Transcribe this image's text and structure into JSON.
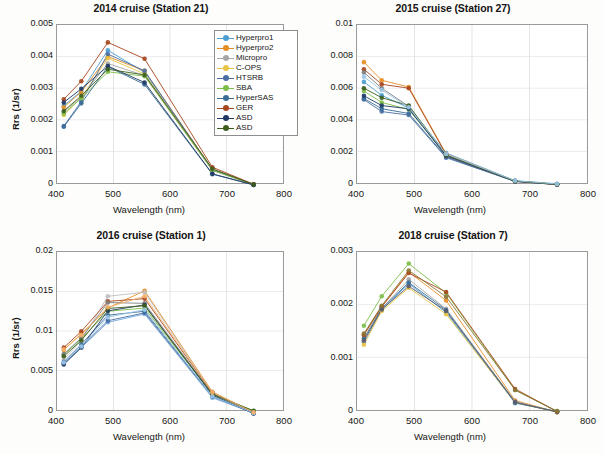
{
  "figure": {
    "xlabel": "Wavelength (nm)",
    "ylabel": "Rrs (1/sr)",
    "xticks": [
      "400",
      "500",
      "600",
      "700",
      "800"
    ],
    "xlim": [
      400,
      800
    ],
    "wavelengths": [
      412,
      443,
      490,
      555,
      675,
      748
    ]
  },
  "colors": {
    "hyperpro1": "#4E9FD1",
    "hyperpro2": "#E58E26",
    "hyperpro3": "#A6A6A6",
    "hyperpro4": "#E8C547",
    "micropro": "#A6A6A6",
    "cops": "#E8C547",
    "htsrb": "#4A6FA5",
    "sba": "#7DBE4A",
    "hypersas": "#3A6E97",
    "ger": "#A8461E",
    "sev": "#7F7F7F",
    "sev1": "#5A5A6E",
    "sev2": "#8A7536",
    "asd": "#1F3864",
    "asd1": "#1F3864",
    "asd2": "#3E5E1E",
    "asd3": "#9CC8E8",
    "asd4": "#F3B169"
  },
  "chart_data": [
    {
      "id": "panel-1",
      "type": "line",
      "title": "2014 cruise (Station 21)",
      "xlabel": "Wavelength (nm)",
      "ylabel": "Rrs (1/sr)",
      "xlim": [
        400,
        800
      ],
      "ylim": [
        0,
        0.005
      ],
      "yticks": [
        "0",
        "0.001",
        "0.002",
        "0.003",
        "0.004",
        "0.005"
      ],
      "ytickvals": [
        0,
        0.001,
        0.002,
        0.003,
        0.004,
        0.005
      ],
      "grid": true,
      "legend_position": "upper-right",
      "x": [
        412,
        443,
        490,
        555,
        675,
        748
      ],
      "series": [
        {
          "name": "Hyperpro1",
          "color": "#4E9FD1",
          "values": [
            0.00245,
            0.0029,
            0.0042,
            0.0035,
            0.00043,
            -4e-05
          ]
        },
        {
          "name": "Hyperpro2",
          "color": "#E58E26",
          "values": [
            0.0024,
            0.00288,
            0.004,
            0.00355,
            0.00044,
            -4e-05
          ]
        },
        {
          "name": "Micropro",
          "color": "#A6A6A6",
          "values": [
            0.00225,
            0.00272,
            0.00378,
            0.0034,
            0.0004,
            -5e-05
          ]
        },
        {
          "name": "C-OPS",
          "color": "#E8C547",
          "values": [
            0.00215,
            0.0027,
            0.00395,
            0.00345,
            0.00041,
            -5e-05
          ]
        },
        {
          "name": "HTSRB",
          "color": "#4A6FA5",
          "values": [
            0.0018,
            0.00258,
            0.00408,
            0.00355,
            0.00042,
            -4e-05
          ]
        },
        {
          "name": "SBA",
          "color": "#7DBE4A",
          "values": [
            0.0022,
            0.00268,
            0.00352,
            0.00338,
            0.0004,
            -5e-05
          ]
        },
        {
          "name": "HyperSAS",
          "color": "#3A6E97",
          "values": [
            0.00178,
            0.00252,
            0.00368,
            0.00312,
            0.00028,
            -6e-05
          ]
        },
        {
          "name": "GER",
          "color": "#A8461E",
          "values": [
            0.00265,
            0.00322,
            0.00445,
            0.00393,
            0.0005,
            -4e-05
          ]
        },
        {
          "name": "ASD",
          "color": "#1F3864",
          "values": [
            0.00255,
            0.00298,
            0.0037,
            0.00318,
            0.00029,
            -6e-05
          ]
        },
        {
          "name": "ASD",
          "color": "#3E5E1E",
          "values": [
            0.00228,
            0.00276,
            0.0036,
            0.00342,
            0.00045,
            -5e-05
          ]
        }
      ]
    },
    {
      "id": "panel-2",
      "type": "line",
      "title": "2015 cruise (Station 27)",
      "xlabel": "Wavelength (nm)",
      "ylabel": "Rrs (1/sr)",
      "xlim": [
        400,
        800
      ],
      "ylim": [
        0,
        0.01
      ],
      "yticks": [
        "0",
        "0.002",
        "0.004",
        "0.006",
        "0.008",
        "0.01"
      ],
      "ytickvals": [
        0,
        0.002,
        0.004,
        0.006,
        0.008,
        0.01
      ],
      "grid": true,
      "legend_position": "upper-right",
      "x": [
        412,
        443,
        490,
        555,
        675,
        748
      ],
      "series": [
        {
          "name": "Hyperpro1",
          "color": "#4E9FD1",
          "values": [
            0.0064,
            0.00555,
            0.00475,
            0.0019,
            0.00015,
            -5e-05
          ]
        },
        {
          "name": "Hyperpro2",
          "color": "#E58E26",
          "values": [
            0.00765,
            0.0065,
            0.00608,
            0.00185,
            0.00012,
            -8e-05
          ]
        },
        {
          "name": "HTSRB",
          "color": "#4A6FA5",
          "values": [
            0.00528,
            0.00452,
            0.0043,
            0.0016,
            0.0001,
            -0.0001
          ]
        },
        {
          "name": "SBA",
          "color": "#7DBE4A",
          "values": [
            0.00582,
            0.0051,
            0.00465,
            0.00175,
            0.00012,
            -8e-05
          ]
        },
        {
          "name": "HyperSAS",
          "color": "#3A6E97",
          "values": [
            0.00535,
            0.0047,
            0.0044,
            0.00165,
            0.0001,
            -9e-05
          ]
        },
        {
          "name": "GER",
          "color": "#A8461E",
          "values": [
            0.0072,
            0.00625,
            0.006,
            0.0018,
            0.00012,
            -0.0001
          ]
        },
        {
          "name": "SEV",
          "color": "#7F7F7F",
          "values": [
            0.007,
            0.006,
            0.00485,
            0.0017,
            0.0001,
            -9e-05
          ]
        },
        {
          "name": "ASD 1",
          "color": "#1F3864",
          "values": [
            0.00552,
            0.0049,
            0.0047,
            0.00172,
            0.00011,
            -8e-05
          ]
        },
        {
          "name": "ASD 2",
          "color": "#3E5E1E",
          "values": [
            0.006,
            0.0054,
            0.0049,
            0.00178,
            0.00012,
            -8e-05
          ]
        },
        {
          "name": "ASD 3",
          "color": "#9CC8E8",
          "values": [
            0.00672,
            0.00588,
            0.0048,
            0.00183,
            0.00014,
            -6e-05
          ]
        }
      ]
    },
    {
      "id": "panel-3",
      "type": "line",
      "title": "2016 cruise (Station 1)",
      "xlabel": "Wavelength (nm)",
      "ylabel": "Rrs (1/sr)",
      "xlim": [
        400,
        800
      ],
      "ylim": [
        0,
        0.02
      ],
      "yticks": [
        "0",
        "0.005",
        "0.01",
        "0.015",
        "0.02"
      ],
      "ytickvals": [
        0,
        0.005,
        0.01,
        0.015,
        0.02
      ],
      "grid": true,
      "legend_position": "upper-right",
      "x": [
        412,
        443,
        490,
        555,
        675,
        748
      ],
      "series": [
        {
          "name": "Hyperpro1",
          "color": "#6FA8DC",
          "values": [
            0.0059,
            0.0079,
            0.0111,
            0.01215,
            0.00155,
            -0.0004
          ]
        },
        {
          "name": "Hyperpro2",
          "color": "#E58E26",
          "values": [
            0.0076,
            0.00965,
            0.0129,
            0.0151,
            0.0023,
            -0.0003
          ]
        },
        {
          "name": "Hyperpro3",
          "color": "#BFBFBF",
          "values": [
            0.0064,
            0.0088,
            0.0144,
            0.0149,
            0.00218,
            -0.00032
          ]
        },
        {
          "name": "HTSRB",
          "color": "#4A6FA5",
          "values": [
            0.00592,
            0.008,
            0.0113,
            0.0123,
            0.0017,
            -0.00038
          ]
        },
        {
          "name": "SBA",
          "color": "#7DBE4A",
          "values": [
            0.007,
            0.009,
            0.0125,
            0.0129,
            0.002,
            -0.00012
          ]
        },
        {
          "name": "HyperSAS",
          "color": "#3A6E97",
          "values": [
            0.0061,
            0.0083,
            0.012,
            0.0125,
            0.0018,
            -0.00042
          ]
        },
        {
          "name": "GER",
          "color": "#A8461E",
          "values": [
            0.0079,
            0.00995,
            0.01375,
            0.0141,
            0.00215,
            -0.00028
          ]
        },
        {
          "name": "SEV",
          "color": "#7F7F7F",
          "values": [
            0.0071,
            0.0091,
            0.0136,
            0.0135,
            0.00205,
            -0.0003
          ]
        },
        {
          "name": "ASD 1",
          "color": "#1F3864",
          "values": [
            0.00575,
            0.0079,
            0.01255,
            0.0133,
            0.0019,
            -0.00045
          ]
        },
        {
          "name": "ASD 2",
          "color": "#3E5E1E",
          "values": [
            0.0068,
            0.0088,
            0.01285,
            0.0132,
            0.002,
            -0.0001
          ]
        },
        {
          "name": "ASD 3",
          "color": "#9CC8E8",
          "values": [
            0.006,
            0.00805,
            0.01175,
            0.0127,
            0.00175,
            -0.00038
          ]
        },
        {
          "name": "ASD 4",
          "color": "#F3B169",
          "values": [
            0.0077,
            0.0095,
            0.013,
            0.0144,
            0.00222,
            -0.0003
          ]
        }
      ]
    },
    {
      "id": "panel-4",
      "type": "line",
      "title": "2018 cruise (Station 7)",
      "xlabel": "Wavelength (nm)",
      "ylabel": "Rrs (1/sr)",
      "xlim": [
        400,
        800
      ],
      "ylim": [
        0,
        0.003
      ],
      "yticks": [
        "0",
        "0.001",
        "0.002",
        "0.003"
      ],
      "ytickvals": [
        0,
        0.001,
        0.002,
        0.003
      ],
      "grid": true,
      "legend_position": "upper-right",
      "x": [
        412,
        443,
        490,
        555,
        675,
        748
      ],
      "series": [
        {
          "name": "Hyperpro1",
          "color": "#4E9FD1",
          "values": [
            0.00128,
            0.0019,
            0.0024,
            0.00185,
            0.00013,
            -3e-05
          ]
        },
        {
          "name": "Hyperpro2",
          "color": "#E58E26",
          "values": [
            0.00142,
            0.00196,
            0.00262,
            0.00208,
            0.00018,
            -4e-05
          ]
        },
        {
          "name": "Hyperpro3",
          "color": "#A6A6A6",
          "values": [
            0.0013,
            0.00192,
            0.00248,
            0.00192,
            0.00016,
            -4e-05
          ]
        },
        {
          "name": "Hyperpro4",
          "color": "#E8C547",
          "values": [
            0.00124,
            0.00188,
            0.00232,
            0.00182,
            0.00014,
            -4e-05
          ]
        },
        {
          "name": "HTSRB",
          "color": "#3A6E97",
          "values": [
            0.00136,
            0.00193,
            0.00242,
            0.0019,
            0.00014,
            -3e-05
          ]
        },
        {
          "name": "SBA",
          "color": "#7DBE4A",
          "values": [
            0.0016,
            0.00216,
            0.00278,
            0.00222,
            0.00038,
            -2e-05
          ]
        },
        {
          "name": "GER",
          "color": "#A8461E",
          "values": [
            0.00143,
            0.00196,
            0.0026,
            0.00224,
            0.0004,
            -3e-05
          ]
        },
        {
          "name": "SEV1",
          "color": "#5A5A6E",
          "values": [
            0.00132,
            0.00191,
            0.00235,
            0.00188,
            0.00015,
            -4e-05
          ]
        },
        {
          "name": "SEV2",
          "color": "#8A7536",
          "values": [
            0.00145,
            0.00198,
            0.00265,
            0.00215,
            0.00038,
            -3e-05
          ]
        }
      ]
    }
  ]
}
